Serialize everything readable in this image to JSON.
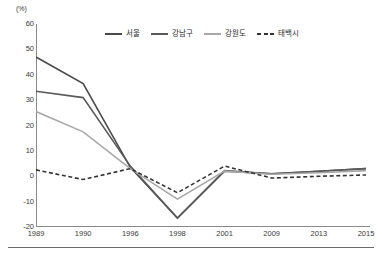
{
  "chart_data": {
    "type": "line",
    "title": "",
    "subtitle": "",
    "unit_label": "(%)",
    "xlabel": "",
    "ylabel": "",
    "categories": [
      "1989",
      "1990",
      "1996",
      "1998",
      "2001",
      "2009",
      "2013",
      "2015"
    ],
    "ylim": [
      -20,
      60
    ],
    "yticks": [
      60,
      50,
      40,
      30,
      20,
      10,
      0,
      -10,
      -20
    ],
    "yticklabels": [
      "60",
      "50",
      "40",
      "30",
      "20",
      "10",
      "0",
      "-10",
      "-20"
    ],
    "grid": false,
    "legend_position": "top-center",
    "series": [
      {
        "name": "서울",
        "color": "#4a4a4a",
        "dash": "solid",
        "width": 1.6,
        "values": [
          47.0,
          36.5,
          3.5,
          -16.5,
          2.0,
          1.0,
          2.0,
          3.0
        ]
      },
      {
        "name": "강남구",
        "color": "#5a5a5a",
        "dash": "solid",
        "width": 1.6,
        "values": [
          33.5,
          31.0,
          4.0,
          -16.5,
          2.2,
          1.0,
          2.0,
          3.0
        ]
      },
      {
        "name": "강원도",
        "color": "#a8a8a8",
        "dash": "solid",
        "width": 1.6,
        "values": [
          25.5,
          17.5,
          3.0,
          -9.0,
          2.0,
          0.8,
          1.4,
          2.2
        ]
      },
      {
        "name": "태백시",
        "color": "#333333",
        "dash": "dashed",
        "width": 1.6,
        "values": [
          2.5,
          -1.3,
          3.0,
          -6.5,
          4.0,
          -0.7,
          0.0,
          0.5
        ]
      }
    ]
  }
}
